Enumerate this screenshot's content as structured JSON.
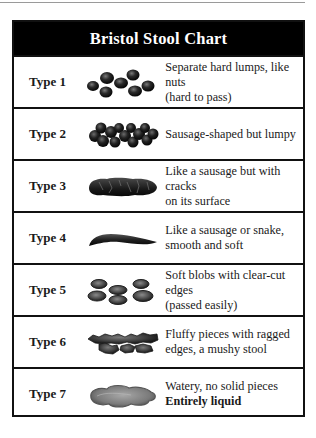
{
  "chart": {
    "title": "Bristol Stool Chart",
    "rows": [
      {
        "label": "Type 1",
        "icon": "separate-hard-lumps",
        "line1": "Separate hard lumps, like nuts",
        "line2": "(hard to pass)"
      },
      {
        "label": "Type 2",
        "icon": "lumpy-sausage",
        "line1": "Sausage-shaped but lumpy",
        "line2": ""
      },
      {
        "label": "Type 3",
        "icon": "cracked-sausage",
        "line1": "Like a sausage but with cracks",
        "line2": "on its surface"
      },
      {
        "label": "Type 4",
        "icon": "smooth-snake",
        "line1": "Like a sausage or snake,",
        "line2": "smooth and soft"
      },
      {
        "label": "Type 5",
        "icon": "soft-blobs",
        "line1": "Soft blobs with clear-cut edges",
        "line2": "(passed easily)"
      },
      {
        "label": "Type 6",
        "icon": "fluffy-pieces",
        "line1": "Fluffy pieces with ragged",
        "line2": "edges, a mushy stool"
      },
      {
        "label": "Type 7",
        "icon": "watery-puddle",
        "line1": "Watery, no solid pieces",
        "line2": "Entirely liquid",
        "line2_bold": true
      }
    ]
  },
  "colors": {
    "header_bg": "#000000",
    "header_text": "#ffffff",
    "border": "#111111",
    "stool_dark": "#1e1e1e",
    "stool_mid": "#555555",
    "liquid": "#8a8a8a"
  }
}
